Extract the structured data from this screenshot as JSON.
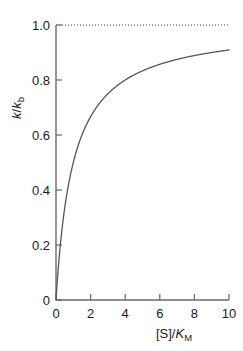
{
  "chart_data": {
    "type": "line",
    "title": "",
    "subtitle": "",
    "xlabel": "[S]/K_M",
    "ylabel": "k/k_b",
    "xlabel_parts": {
      "pre": "[S]/",
      "italic": "K",
      "subscript": "M"
    },
    "ylabel_parts": {
      "italic1": "k",
      "slash": "/",
      "italic2": "k",
      "subscript": "b"
    },
    "xlim": [
      0,
      10
    ],
    "ylim": [
      0,
      1.0
    ],
    "xticks": [
      0,
      2,
      4,
      6,
      8,
      10
    ],
    "yticks": [
      0,
      0.2,
      0.4,
      0.6,
      0.8,
      1.0
    ],
    "xtick_labels": [
      "0",
      "2",
      "4",
      "6",
      "8",
      "10"
    ],
    "ytick_labels": [
      "0",
      "0.2",
      "0.4",
      "0.6",
      "0.8",
      "1.0"
    ],
    "grid": false,
    "legend": "none",
    "equation": "y = x / (1 + x)",
    "series": [
      {
        "name": "Michaelis-Menten saturation",
        "style": "solid",
        "color": "#555555",
        "x": [
          0,
          0.1,
          0.2,
          0.3,
          0.4,
          0.5,
          0.6,
          0.7,
          0.8,
          0.9,
          1.0,
          1.25,
          1.5,
          1.75,
          2.0,
          2.5,
          3.0,
          3.5,
          4.0,
          4.5,
          5.0,
          5.5,
          6.0,
          6.5,
          7.0,
          7.5,
          8.0,
          8.5,
          9.0,
          9.5,
          10.0
        ],
        "values": [
          0,
          0.0909,
          0.1667,
          0.2308,
          0.2857,
          0.3333,
          0.375,
          0.4118,
          0.4444,
          0.4737,
          0.5,
          0.5556,
          0.6,
          0.6364,
          0.6667,
          0.7143,
          0.75,
          0.7778,
          0.8,
          0.8182,
          0.8333,
          0.8462,
          0.8571,
          0.8667,
          0.875,
          0.8824,
          0.8889,
          0.8947,
          0.9,
          0.9048,
          0.9091
        ]
      }
    ],
    "annotations": [
      {
        "name": "asymptote",
        "type": "hline",
        "value": 1.0,
        "style": "dotted",
        "color": "#444444",
        "label": ""
      }
    ],
    "colors": {
      "background": "#ffffff",
      "axis": "#6a6a6a",
      "curve": "#555555",
      "asymptote": "#444444",
      "text": "#1a1a1a"
    }
  }
}
